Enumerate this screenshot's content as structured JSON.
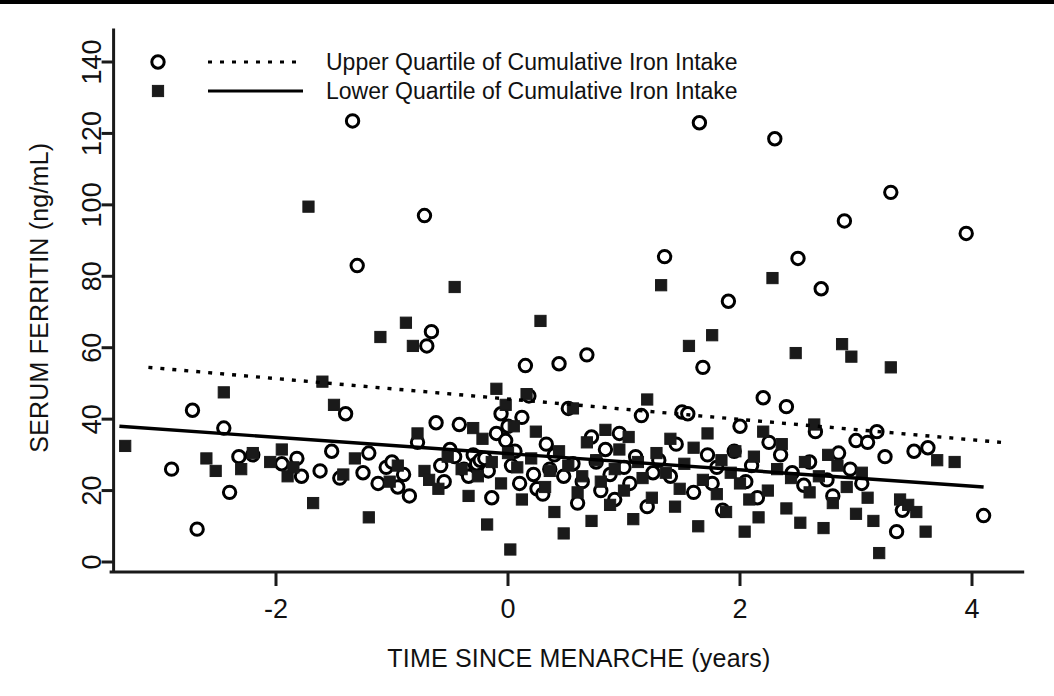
{
  "chart_data": {
    "type": "scatter",
    "title": "",
    "xlabel": "TIME SINCE MENARCHE (years)",
    "ylabel": "SERUM FERRITIN (ng/mL)",
    "xlim": [
      -3.4,
      4.45
    ],
    "ylim": [
      0,
      148
    ],
    "xticks": [
      -2,
      0,
      2,
      4
    ],
    "xtick_labels": [
      "-2",
      "0",
      "2",
      "4"
    ],
    "yticks": [
      0,
      20,
      40,
      60,
      80,
      100,
      120,
      140
    ],
    "ytick_labels": [
      "0",
      "20",
      "40",
      "60",
      "80",
      "100",
      "120",
      "140"
    ],
    "grid": false,
    "legend_position": "top-left",
    "legend": [
      {
        "label": "Upper Quartile of Cumulative Iron Intake",
        "marker": "open-circle",
        "line": "dotted"
      },
      {
        "label": "Lower Quartile of Cumulative Iron Intake",
        "marker": "filled-square",
        "line": "solid"
      }
    ],
    "series": [
      {
        "name": "Upper Quartile of Cumulative Iron Intake",
        "marker": "open-circle",
        "color": "#000000",
        "trendline": {
          "style": "dotted",
          "x": [
            -3.1,
            4.25
          ],
          "y": [
            54.5,
            33.5
          ]
        },
        "points": [
          [
            -2.9,
            26.0
          ],
          [
            -2.72,
            42.5
          ],
          [
            -2.68,
            9.2
          ],
          [
            -2.45,
            37.5
          ],
          [
            -2.4,
            19.5
          ],
          [
            -2.32,
            29.5
          ],
          [
            -2.2,
            30.0
          ],
          [
            -1.95,
            27.5
          ],
          [
            -1.82,
            29.0
          ],
          [
            -1.78,
            24.0
          ],
          [
            -1.62,
            25.5
          ],
          [
            -1.52,
            31.0
          ],
          [
            -1.45,
            23.5
          ],
          [
            -1.4,
            41.5
          ],
          [
            -1.34,
            123.5
          ],
          [
            -1.3,
            83.0
          ],
          [
            -1.25,
            25.0
          ],
          [
            -1.2,
            30.5
          ],
          [
            -1.12,
            22.0
          ],
          [
            -1.05,
            26.5
          ],
          [
            -1.0,
            28.0
          ],
          [
            -0.95,
            21.0
          ],
          [
            -0.9,
            24.5
          ],
          [
            -0.85,
            18.5
          ],
          [
            -0.78,
            33.5
          ],
          [
            -0.72,
            97.0
          ],
          [
            -0.7,
            60.5
          ],
          [
            -0.66,
            64.5
          ],
          [
            -0.62,
            39.0
          ],
          [
            -0.58,
            27.0
          ],
          [
            -0.55,
            22.5
          ],
          [
            -0.5,
            31.5
          ],
          [
            -0.46,
            29.5
          ],
          [
            -0.42,
            38.5
          ],
          [
            -0.38,
            26.0
          ],
          [
            -0.34,
            24.0
          ],
          [
            -0.3,
            30.0
          ],
          [
            -0.27,
            27.5
          ],
          [
            -0.24,
            28.5
          ],
          [
            -0.2,
            29.0
          ],
          [
            -0.17,
            25.5
          ],
          [
            -0.14,
            18.0
          ],
          [
            -0.1,
            36.0
          ],
          [
            -0.06,
            41.5
          ],
          [
            -0.02,
            34.0
          ],
          [
            0.0,
            38.0
          ],
          [
            0.03,
            27.0
          ],
          [
            0.06,
            31.0
          ],
          [
            0.1,
            22.0
          ],
          [
            0.12,
            40.5
          ],
          [
            0.15,
            55.0
          ],
          [
            0.18,
            46.5
          ],
          [
            0.22,
            24.5
          ],
          [
            0.25,
            20.5
          ],
          [
            0.3,
            19.0
          ],
          [
            0.33,
            33.0
          ],
          [
            0.36,
            26.0
          ],
          [
            0.4,
            30.0
          ],
          [
            0.44,
            55.5
          ],
          [
            0.48,
            24.0
          ],
          [
            0.52,
            43.0
          ],
          [
            0.56,
            27.5
          ],
          [
            0.6,
            16.5
          ],
          [
            0.64,
            22.5
          ],
          [
            0.68,
            58.0
          ],
          [
            0.72,
            35.0
          ],
          [
            0.76,
            28.0
          ],
          [
            0.8,
            20.0
          ],
          [
            0.84,
            31.5
          ],
          [
            0.88,
            24.5
          ],
          [
            0.92,
            17.5
          ],
          [
            0.96,
            36.0
          ],
          [
            1.0,
            26.5
          ],
          [
            1.05,
            22.0
          ],
          [
            1.1,
            29.5
          ],
          [
            1.15,
            41.0
          ],
          [
            1.2,
            15.5
          ],
          [
            1.25,
            25.0
          ],
          [
            1.3,
            28.5
          ],
          [
            1.35,
            85.5
          ],
          [
            1.4,
            24.0
          ],
          [
            1.45,
            33.0
          ],
          [
            1.5,
            42.0
          ],
          [
            1.55,
            41.5
          ],
          [
            1.6,
            19.5
          ],
          [
            1.65,
            123.0
          ],
          [
            1.68,
            54.5
          ],
          [
            1.72,
            30.0
          ],
          [
            1.76,
            22.0
          ],
          [
            1.8,
            26.5
          ],
          [
            1.85,
            14.5
          ],
          [
            1.9,
            73.0
          ],
          [
            1.95,
            31.0
          ],
          [
            2.0,
            38.0
          ],
          [
            2.05,
            22.5
          ],
          [
            2.1,
            27.0
          ],
          [
            2.15,
            18.0
          ],
          [
            2.2,
            46.0
          ],
          [
            2.25,
            33.5
          ],
          [
            2.3,
            118.5
          ],
          [
            2.35,
            30.0
          ],
          [
            2.4,
            43.5
          ],
          [
            2.45,
            25.0
          ],
          [
            2.5,
            85.0
          ],
          [
            2.55,
            21.5
          ],
          [
            2.6,
            28.0
          ],
          [
            2.65,
            36.5
          ],
          [
            2.7,
            76.5
          ],
          [
            2.75,
            23.0
          ],
          [
            2.8,
            18.5
          ],
          [
            2.85,
            30.5
          ],
          [
            2.9,
            95.5
          ],
          [
            2.95,
            26.0
          ],
          [
            3.0,
            34.0
          ],
          [
            3.05,
            22.0
          ],
          [
            3.1,
            33.5
          ],
          [
            3.18,
            36.5
          ],
          [
            3.25,
            29.5
          ],
          [
            3.3,
            103.5
          ],
          [
            3.35,
            8.5
          ],
          [
            3.4,
            14.5
          ],
          [
            3.5,
            31.0
          ],
          [
            3.62,
            32.0
          ],
          [
            3.95,
            92.0
          ],
          [
            4.1,
            13.0
          ]
        ]
      },
      {
        "name": "Lower Quartile of Cumulative Iron Intake",
        "marker": "filled-square",
        "color": "#000000",
        "trendline": {
          "style": "solid",
          "x": [
            -3.35,
            4.1
          ],
          "y": [
            38.0,
            21.0
          ]
        },
        "points": [
          [
            -3.3,
            32.5
          ],
          [
            -2.6,
            29.0
          ],
          [
            -2.52,
            25.5
          ],
          [
            -2.45,
            47.5
          ],
          [
            -2.3,
            26.0
          ],
          [
            -2.2,
            30.5
          ],
          [
            -2.05,
            28.0
          ],
          [
            -1.95,
            31.5
          ],
          [
            -1.9,
            24.0
          ],
          [
            -1.85,
            26.5
          ],
          [
            -1.72,
            99.5
          ],
          [
            -1.68,
            16.5
          ],
          [
            -1.6,
            50.5
          ],
          [
            -1.5,
            44.0
          ],
          [
            -1.42,
            24.5
          ],
          [
            -1.32,
            29.0
          ],
          [
            -1.2,
            12.5
          ],
          [
            -1.1,
            63.0
          ],
          [
            -1.02,
            22.5
          ],
          [
            -0.95,
            27.0
          ],
          [
            -0.88,
            67.0
          ],
          [
            -0.82,
            60.5
          ],
          [
            -0.78,
            36.0
          ],
          [
            -0.72,
            25.5
          ],
          [
            -0.68,
            23.0
          ],
          [
            -0.6,
            20.5
          ],
          [
            -0.52,
            29.5
          ],
          [
            -0.46,
            77.0
          ],
          [
            -0.4,
            26.0
          ],
          [
            -0.34,
            18.5
          ],
          [
            -0.3,
            37.5
          ],
          [
            -0.26,
            24.0
          ],
          [
            -0.22,
            34.5
          ],
          [
            -0.18,
            10.5
          ],
          [
            -0.14,
            28.0
          ],
          [
            -0.1,
            48.5
          ],
          [
            -0.06,
            22.0
          ],
          [
            -0.02,
            44.0
          ],
          [
            0.0,
            30.5
          ],
          [
            0.02,
            3.5
          ],
          [
            0.05,
            38.0
          ],
          [
            0.08,
            26.5
          ],
          [
            0.12,
            17.5
          ],
          [
            0.16,
            47.0
          ],
          [
            0.2,
            29.0
          ],
          [
            0.24,
            36.5
          ],
          [
            0.28,
            67.5
          ],
          [
            0.32,
            21.0
          ],
          [
            0.36,
            25.5
          ],
          [
            0.4,
            14.0
          ],
          [
            0.44,
            31.0
          ],
          [
            0.48,
            8.0
          ],
          [
            0.52,
            27.0
          ],
          [
            0.56,
            43.0
          ],
          [
            0.6,
            19.5
          ],
          [
            0.64,
            24.0
          ],
          [
            0.68,
            33.5
          ],
          [
            0.72,
            11.5
          ],
          [
            0.76,
            28.5
          ],
          [
            0.8,
            22.5
          ],
          [
            0.84,
            37.0
          ],
          [
            0.88,
            16.0
          ],
          [
            0.92,
            26.0
          ],
          [
            0.96,
            31.5
          ],
          [
            1.0,
            20.0
          ],
          [
            1.04,
            35.0
          ],
          [
            1.08,
            12.0
          ],
          [
            1.12,
            28.0
          ],
          [
            1.16,
            23.5
          ],
          [
            1.2,
            45.5
          ],
          [
            1.24,
            18.0
          ],
          [
            1.28,
            30.5
          ],
          [
            1.32,
            77.5
          ],
          [
            1.36,
            25.0
          ],
          [
            1.4,
            34.5
          ],
          [
            1.44,
            15.5
          ],
          [
            1.48,
            20.5
          ],
          [
            1.52,
            27.5
          ],
          [
            1.56,
            60.5
          ],
          [
            1.6,
            32.0
          ],
          [
            1.64,
            10.0
          ],
          [
            1.68,
            23.0
          ],
          [
            1.72,
            36.0
          ],
          [
            1.76,
            63.5
          ],
          [
            1.8,
            19.0
          ],
          [
            1.84,
            28.5
          ],
          [
            1.88,
            14.0
          ],
          [
            1.92,
            25.0
          ],
          [
            1.96,
            31.0
          ],
          [
            2.0,
            22.0
          ],
          [
            2.04,
            8.5
          ],
          [
            2.08,
            17.5
          ],
          [
            2.12,
            29.5
          ],
          [
            2.16,
            12.5
          ],
          [
            2.2,
            36.5
          ],
          [
            2.24,
            20.0
          ],
          [
            2.28,
            79.5
          ],
          [
            2.32,
            26.0
          ],
          [
            2.36,
            33.0
          ],
          [
            2.4,
            15.0
          ],
          [
            2.44,
            23.5
          ],
          [
            2.48,
            58.5
          ],
          [
            2.52,
            11.0
          ],
          [
            2.56,
            28.0
          ],
          [
            2.6,
            19.5
          ],
          [
            2.64,
            38.5
          ],
          [
            2.68,
            24.0
          ],
          [
            2.72,
            9.5
          ],
          [
            2.76,
            30.0
          ],
          [
            2.8,
            16.5
          ],
          [
            2.84,
            27.0
          ],
          [
            2.88,
            61.0
          ],
          [
            2.92,
            21.0
          ],
          [
            2.96,
            57.5
          ],
          [
            3.0,
            13.5
          ],
          [
            3.05,
            25.0
          ],
          [
            3.1,
            18.0
          ],
          [
            3.15,
            11.5
          ],
          [
            3.2,
            2.5
          ],
          [
            3.3,
            54.5
          ],
          [
            3.38,
            17.5
          ],
          [
            3.45,
            16.0
          ],
          [
            3.52,
            14.0
          ],
          [
            3.6,
            8.5
          ],
          [
            3.7,
            28.5
          ],
          [
            3.85,
            28.0
          ]
        ]
      }
    ]
  }
}
